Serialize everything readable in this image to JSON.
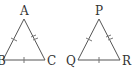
{
  "diagram": {
    "type": "congruent-equilateral-triangles",
    "triangles": [
      {
        "name": "ABC",
        "vertices": {
          "A": {
            "label": "A",
            "x": 24,
            "y": 19
          },
          "B": {
            "label": "B",
            "x": 3,
            "y": 60
          },
          "C": {
            "label": "C",
            "x": 45,
            "y": 60
          }
        },
        "sides": [
          {
            "from": "A",
            "to": "B",
            "ticks": 1
          },
          {
            "from": "A",
            "to": "C",
            "ticks": 2
          },
          {
            "from": "B",
            "to": "C",
            "ticks": 1
          }
        ]
      },
      {
        "name": "PQR",
        "vertices": {
          "P": {
            "label": "P",
            "x": 99,
            "y": 19
          },
          "Q": {
            "label": "Q",
            "x": 78,
            "y": 60
          },
          "R": {
            "label": "R",
            "x": 120,
            "y": 60
          }
        },
        "sides": [
          {
            "from": "P",
            "to": "Q",
            "ticks": 1
          },
          {
            "from": "P",
            "to": "R",
            "ticks": 2
          },
          {
            "from": "Q",
            "to": "R",
            "ticks": 1
          }
        ]
      }
    ],
    "labels": {
      "A": "A",
      "B": "B",
      "C": "C",
      "P": "P",
      "Q": "Q",
      "R": "R"
    }
  }
}
